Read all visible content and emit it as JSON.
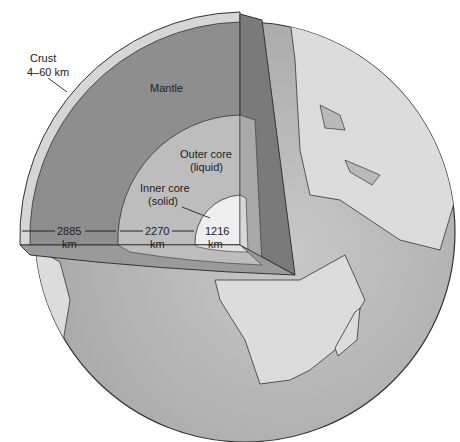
{
  "diagram": {
    "colors": {
      "ocean": "#b9b9b9",
      "land": "#dcdcdc",
      "crust": "#d6d6d6",
      "mantle": "#8e8e8e",
      "mantle_side": "#7a7a7a",
      "outer_core": "#bdbdbd",
      "inner_core": "#eeeeee",
      "outline": "#333333"
    },
    "labels": {
      "crust_title": "Crust",
      "crust_range": "4–60 km",
      "mantle": "Mantle",
      "outer_core_1": "Outer core",
      "outer_core_2": "(liquid)",
      "inner_core_1": "Inner core",
      "inner_core_2": "(solid)"
    },
    "dimensions": [
      {
        "value": "2885",
        "unit": "km",
        "layer": "mantle"
      },
      {
        "value": "2270",
        "unit": "km",
        "layer": "outer core"
      },
      {
        "value": "1216",
        "unit": "km",
        "layer": "inner core"
      }
    ]
  }
}
